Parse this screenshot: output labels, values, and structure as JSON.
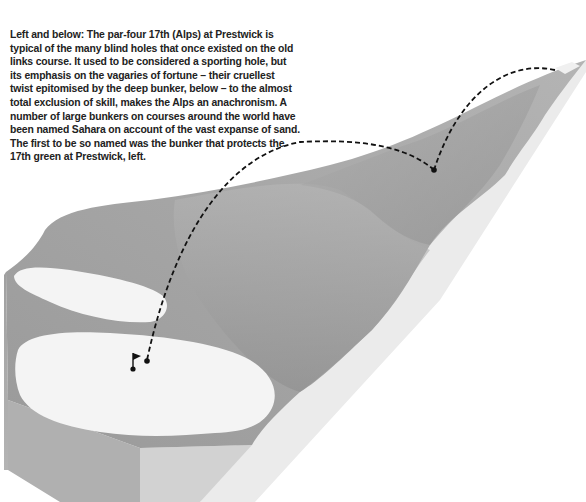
{
  "caption": {
    "text": "Left and below: The par-four 17th (Alps) at Prestwick is typical of the many blind holes that once existed on the old links course. It used to be considered a sporting hole, but its emphasis on the vagaries of fortune – their cruellest twist epitomised by the deep bunker, below – to the almost total exclusion of skill, makes the Alps an anachronism. A number of large bunkers on courses around the world have been named Sahara on account of the vast expanse of sand. The first to be so named was the bunker that protects the 17th green at Prestwick, left."
  },
  "illustration": {
    "subject": "Prestwick 17th hole (Alps) 3D terrain diagram",
    "features": [
      "tee",
      "fairway",
      "blind hill ridge",
      "Sahara bunker",
      "green",
      "flag",
      "ball flight path"
    ],
    "colors": {
      "terrain_dark": "#8f8f8f",
      "terrain_mid": "#a8a8a8",
      "terrain_light": "#c4c4c4",
      "side_face": "#e9e9e9",
      "sand_and_green": "#f4f4f4",
      "path": "#111111"
    }
  }
}
